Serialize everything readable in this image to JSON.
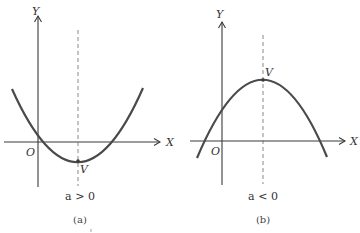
{
  "figure": {
    "panels": [
      {
        "id": "a",
        "caption": "(a)",
        "condition": "a > 0",
        "x_axis_label": "X",
        "y_axis_label": "Y",
        "origin_label": "O",
        "vertex_label": "V",
        "opens": "upward"
      },
      {
        "id": "b",
        "caption": "(b)",
        "condition": "a < 0",
        "x_axis_label": "X",
        "y_axis_label": "Y",
        "origin_label": "O",
        "vertex_label": "V",
        "opens": "downward"
      }
    ]
  }
}
